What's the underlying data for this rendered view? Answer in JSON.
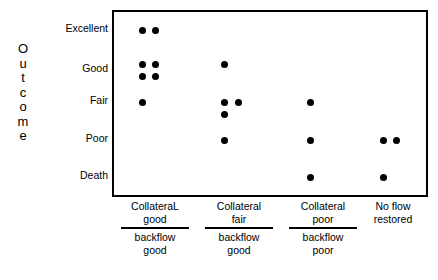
{
  "chart_data": {
    "type": "scatter",
    "title": "",
    "subtitle": "",
    "xlabel": "",
    "ylabel": "Outcome",
    "grid": false,
    "legend": null,
    "y_categories": [
      "Excellent",
      "Good",
      "Fair",
      "Poor",
      "Death"
    ],
    "x_categories": [
      "Collateral good / backflow good",
      "Collateral fair / backflow good",
      "Collateral poor / backflow poor",
      "No flow restored"
    ],
    "counts_by_cell": [
      {
        "x": "Collateral good / backflow good",
        "Excellent": 2,
        "Good": 4,
        "Fair": 1,
        "Poor": 0,
        "Death": 0
      },
      {
        "x": "Collateral fair / backflow good",
        "Excellent": 0,
        "Good": 1,
        "Fair": 3,
        "Poor": 1,
        "Death": 0
      },
      {
        "x": "Collateral poor / backflow poor",
        "Excellent": 0,
        "Good": 0,
        "Fair": 1,
        "Poor": 1,
        "Death": 1
      },
      {
        "x": "No flow restored",
        "Excellent": 0,
        "Good": 0,
        "Fair": 0,
        "Poor": 2,
        "Death": 1
      }
    ],
    "points": [
      {
        "group": 1,
        "category": "Excellent",
        "left": 28,
        "top": 18
      },
      {
        "group": 1,
        "category": "Excellent",
        "left": 41,
        "top": 18
      },
      {
        "group": 1,
        "category": "Good",
        "left": 28,
        "top": 52
      },
      {
        "group": 1,
        "category": "Good",
        "left": 41,
        "top": 52
      },
      {
        "group": 1,
        "category": "Good",
        "left": 28,
        "top": 64
      },
      {
        "group": 1,
        "category": "Good",
        "left": 41,
        "top": 64
      },
      {
        "group": 1,
        "category": "Fair",
        "left": 28,
        "top": 90
      },
      {
        "group": 2,
        "category": "Good",
        "left": 110,
        "top": 52
      },
      {
        "group": 2,
        "category": "Fair",
        "left": 110,
        "top": 90
      },
      {
        "group": 2,
        "category": "Fair",
        "left": 124,
        "top": 90
      },
      {
        "group": 2,
        "category": "Fair",
        "left": 110,
        "top": 102
      },
      {
        "group": 2,
        "category": "Poor",
        "left": 110,
        "top": 128
      },
      {
        "group": 3,
        "category": "Fair",
        "left": 196,
        "top": 90
      },
      {
        "group": 3,
        "category": "Poor",
        "left": 196,
        "top": 128
      },
      {
        "group": 3,
        "category": "Death",
        "left": 196,
        "top": 165
      },
      {
        "group": 4,
        "category": "Poor",
        "left": 269,
        "top": 128
      },
      {
        "group": 4,
        "category": "Poor",
        "left": 282,
        "top": 128
      },
      {
        "group": 4,
        "category": "Death",
        "left": 269,
        "top": 165
      }
    ]
  },
  "axis": {
    "y_title_letters": [
      "O",
      "u",
      "t",
      "c",
      "o",
      "m",
      "e"
    ],
    "y_ticks": [
      {
        "label": "Excellent",
        "top": 28
      },
      {
        "label": "Good",
        "top": 68
      },
      {
        "label": "Fair",
        "top": 100
      },
      {
        "label": "Poor",
        "top": 138
      },
      {
        "label": "Death",
        "top": 175
      }
    ],
    "x_groups": [
      {
        "numerator_line1": "CollateraL",
        "numerator_line2": "good",
        "denominator_line1": "backflow",
        "denominator_line2": "good",
        "has_rule": true,
        "left": 0,
        "width": 86,
        "rule_width": 68
      },
      {
        "numerator_line1": "Collateral",
        "numerator_line2": "fair",
        "denominator_line1": "backflow",
        "denominator_line2": "good",
        "has_rule": true,
        "left": 84,
        "width": 86,
        "rule_width": 68
      },
      {
        "numerator_line1": "Collateral",
        "numerator_line2": "poor",
        "denominator_line1": "backflow",
        "denominator_line2": "poor",
        "has_rule": true,
        "left": 168,
        "width": 86,
        "rule_width": 68
      },
      {
        "numerator_line1": "No flow",
        "numerator_line2": "restored",
        "denominator_line1": "",
        "denominator_line2": "",
        "has_rule": false,
        "left": 238,
        "width": 86,
        "rule_width": 0
      }
    ]
  },
  "colors": {
    "point": "#000000",
    "frame": "#000000",
    "text": "#000000",
    "background": "#ffffff"
  }
}
